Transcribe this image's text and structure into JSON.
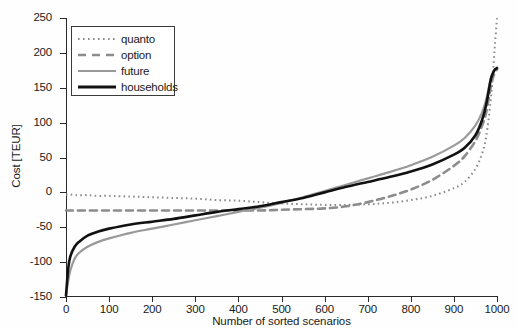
{
  "figure": {
    "ylabel": "Cost [TEUR]",
    "xlabel": "Number of sorted scenarios"
  },
  "legend": {
    "items": [
      {
        "label": "quanto",
        "style": "dotted",
        "color": "#8c8c8c"
      },
      {
        "label": "option",
        "style": "dashed",
        "color": "#8c8c8c"
      },
      {
        "label": "future",
        "style": "solid",
        "color": "#999999"
      },
      {
        "label": "households",
        "style": "solid",
        "color": "#111111"
      }
    ]
  },
  "axes": {
    "y_ticks": [
      "250",
      "200",
      "150",
      "100",
      "50",
      "0",
      "-50",
      "-100",
      "-150"
    ],
    "x_ticks": [
      "0",
      "100",
      "200",
      "300",
      "400",
      "500",
      "600",
      "700",
      "800",
      "900",
      "1000"
    ]
  },
  "chart_data": {
    "type": "line",
    "title": "",
    "xlabel": "Number of sorted scenarios",
    "ylabel": "Cost [TEUR]",
    "xlim": [
      0,
      1000
    ],
    "ylim": [
      -150,
      250
    ],
    "y_ticks": [
      -150,
      -100,
      -50,
      0,
      50,
      100,
      150,
      200,
      250
    ],
    "x_ticks": [
      0,
      100,
      200,
      300,
      400,
      500,
      600,
      700,
      800,
      900,
      1000
    ],
    "grid": false,
    "legend_position": "upper left",
    "x": [
      0,
      5,
      10,
      20,
      30,
      50,
      75,
      100,
      150,
      200,
      250,
      300,
      350,
      400,
      450,
      500,
      550,
      600,
      650,
      700,
      750,
      800,
      850,
      900,
      925,
      950,
      965,
      975,
      985,
      990,
      995,
      1000
    ],
    "series": [
      {
        "name": "quanto",
        "style": "dotted",
        "color": "#8c8c8c",
        "values": [
          -3,
          -3,
          -3,
          -4,
          -4,
          -4,
          -5,
          -5,
          -6,
          -7,
          -8,
          -9,
          -11,
          -12,
          -14,
          -16,
          -17,
          -18,
          -18,
          -17,
          -15,
          -11,
          -5,
          6,
          15,
          34,
          55,
          80,
          130,
          165,
          210,
          250
        ]
      },
      {
        "name": "option",
        "style": "dashed",
        "color": "#8c8c8c",
        "values": [
          -26,
          -26,
          -26,
          -26,
          -26,
          -26,
          -26,
          -26,
          -26,
          -26,
          -26,
          -26,
          -26,
          -26,
          -26,
          -25,
          -24,
          -23,
          -20,
          -14,
          -6,
          4,
          18,
          38,
          52,
          74,
          95,
          115,
          150,
          163,
          172,
          176
        ]
      },
      {
        "name": "future",
        "style": "solid",
        "color": "#999999",
        "values": [
          -148,
          -128,
          -112,
          -95,
          -87,
          -78,
          -71,
          -66,
          -58,
          -52,
          -46,
          -40,
          -34,
          -28,
          -22,
          -15,
          -7,
          2,
          11,
          20,
          29,
          39,
          51,
          67,
          78,
          96,
          114,
          133,
          162,
          171,
          176,
          179
        ]
      },
      {
        "name": "households",
        "style": "solid",
        "color": "#111111",
        "values": [
          -148,
          -110,
          -92,
          -78,
          -71,
          -62,
          -56,
          -52,
          -46,
          -42,
          -38,
          -33,
          -28,
          -24,
          -20,
          -14,
          -8,
          0,
          8,
          15,
          22,
          30,
          40,
          54,
          64,
          82,
          103,
          126,
          160,
          170,
          176,
          178
        ]
      }
    ]
  }
}
